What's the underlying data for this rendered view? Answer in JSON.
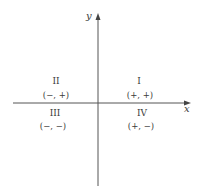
{
  "diagram": {
    "type": "cartesian-quadrants",
    "axes": {
      "x_label": "x",
      "y_label": "y"
    },
    "quadrants": [
      {
        "numeral": "I",
        "signs": "(+, +)",
        "position": "top-right"
      },
      {
        "numeral": "II",
        "signs": "(−, +)",
        "position": "top-left"
      },
      {
        "numeral": "III",
        "signs": "(−, −)",
        "position": "bottom-left"
      },
      {
        "numeral": "IV",
        "signs": "(+, −)",
        "position": "bottom-right"
      }
    ],
    "colors": {
      "line": "#555555",
      "text": "#3a3a3a",
      "background": "#ffffff"
    }
  }
}
